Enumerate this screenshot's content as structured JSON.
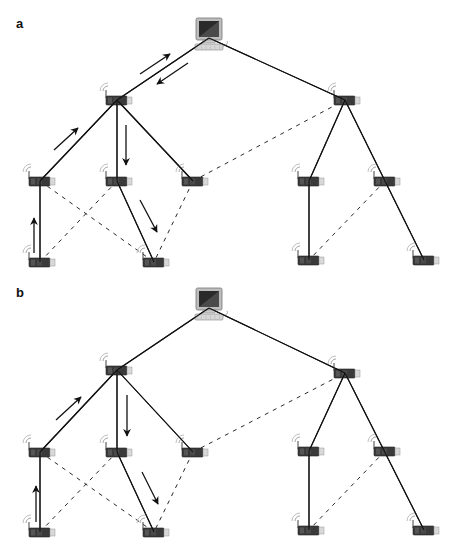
{
  "figure": {
    "panels": [
      {
        "label": "a",
        "description": "Two-way communication: data travels from the computer to a node and back to the computer",
        "computer": {
          "x": 209,
          "y": 40
        },
        "nodes": [
          {
            "id": "R1",
            "x": 117,
            "y": 100,
            "role": "router"
          },
          {
            "id": "R2",
            "x": 345,
            "y": 100,
            "role": "router"
          },
          {
            "id": "A",
            "x": 40,
            "y": 181
          },
          {
            "id": "B",
            "x": 117,
            "y": 181
          },
          {
            "id": "C",
            "x": 193,
            "y": 181
          },
          {
            "id": "D",
            "x": 309,
            "y": 181
          },
          {
            "id": "E",
            "x": 385,
            "y": 181
          },
          {
            "id": "F",
            "x": 40,
            "y": 262
          },
          {
            "id": "G",
            "x": 154,
            "y": 262
          },
          {
            "id": "H",
            "x": 309,
            "y": 260
          },
          {
            "id": "I",
            "x": 424,
            "y": 260
          }
        ],
        "solid_links": [
          [
            "PC",
            "R1"
          ],
          [
            "PC",
            "R2"
          ],
          [
            "R1",
            "A"
          ],
          [
            "R1",
            "B"
          ],
          [
            "R1",
            "C"
          ],
          [
            "A",
            "F"
          ],
          [
            "B",
            "G"
          ],
          [
            "R2",
            "D"
          ],
          [
            "R2",
            "I"
          ],
          [
            "D",
            "H"
          ]
        ],
        "dashed_links": [
          [
            "A",
            "G"
          ],
          [
            "F",
            "B"
          ],
          [
            "C",
            "G"
          ],
          [
            "C",
            "R2"
          ],
          [
            "E",
            "H"
          ]
        ],
        "arrows": [
          {
            "from": [
              140,
              74
            ],
            "to": [
              170,
              54
            ]
          },
          {
            "from": [
              188,
              63
            ],
            "to": [
              157,
              84
            ]
          },
          {
            "from": [
              54,
              150
            ],
            "to": [
              78,
              128
            ]
          },
          {
            "from": [
              126,
              125
            ],
            "to": [
              126,
              165
            ]
          },
          {
            "from": [
              140,
              200
            ],
            "to": [
              157,
              232
            ]
          },
          {
            "from": [
              34,
              253
            ],
            "to": [
              34,
              218
            ]
          }
        ]
      },
      {
        "label": "b",
        "description": "One-way communication: data travels from a node to the computer only on demand",
        "computer": {
          "x": 209,
          "y": 310
        },
        "nodes": [
          {
            "id": "R1",
            "x": 117,
            "y": 370,
            "role": "router"
          },
          {
            "id": "R2",
            "x": 345,
            "y": 373,
            "role": "router"
          },
          {
            "id": "A",
            "x": 40,
            "y": 452
          },
          {
            "id": "B",
            "x": 117,
            "y": 452
          },
          {
            "id": "C",
            "x": 193,
            "y": 452
          },
          {
            "id": "D",
            "x": 309,
            "y": 451
          },
          {
            "id": "E",
            "x": 385,
            "y": 451
          },
          {
            "id": "F",
            "x": 40,
            "y": 532
          },
          {
            "id": "G",
            "x": 154,
            "y": 532
          },
          {
            "id": "H",
            "x": 309,
            "y": 530
          },
          {
            "id": "I",
            "x": 424,
            "y": 530
          }
        ],
        "solid_links": [
          [
            "PC",
            "R1"
          ],
          [
            "PC",
            "R2"
          ],
          [
            "R1",
            "A"
          ],
          [
            "R1",
            "B"
          ],
          [
            "R1",
            "C"
          ],
          [
            "A",
            "F"
          ],
          [
            "B",
            "G"
          ],
          [
            "R2",
            "D"
          ],
          [
            "R2",
            "I"
          ],
          [
            "D",
            "H"
          ]
        ],
        "dashed_links": [
          [
            "A",
            "G"
          ],
          [
            "F",
            "B"
          ],
          [
            "C",
            "G"
          ],
          [
            "C",
            "R2"
          ],
          [
            "E",
            "H"
          ]
        ],
        "arrows": [
          {
            "from": [
              56,
              420
            ],
            "to": [
              81,
              397
            ]
          },
          {
            "from": [
              127,
              395
            ],
            "to": [
              127,
              436
            ]
          },
          {
            "from": [
              142,
              472
            ],
            "to": [
              158,
              504
            ]
          },
          {
            "from": [
              36,
              522
            ],
            "to": [
              36,
              486
            ]
          }
        ]
      }
    ],
    "caption": ""
  },
  "colors": {
    "line": "#111111",
    "device_body": "#3a3a3a",
    "device_cap": "#d8d8d8",
    "signal": "#9a9a9a",
    "screen": "#2a2a2a"
  }
}
